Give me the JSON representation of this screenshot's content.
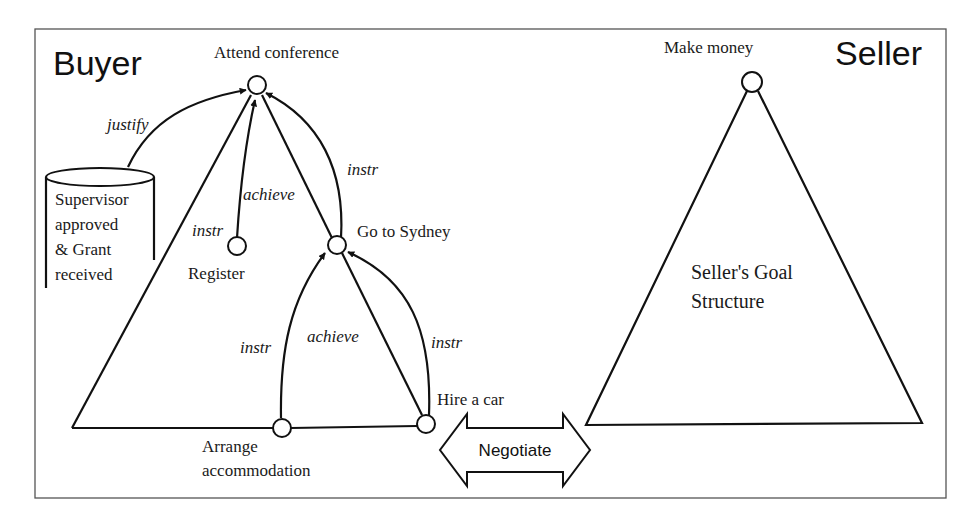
{
  "diagram": {
    "parties": {
      "buyer": {
        "title": "Buyer"
      },
      "seller": {
        "title": "Seller"
      }
    },
    "buyer_nodes": {
      "attend": "Attend conference",
      "register": "Register",
      "sydney": "Go to Sydney",
      "accommodation_line1": "Arrange",
      "accommodation_line2": "accommodation",
      "car": "Hire a car"
    },
    "belief_store": {
      "lines": [
        "Supervisor",
        "approved",
        "& Grant",
        "received"
      ]
    },
    "edge_labels": {
      "justify": "justify",
      "instr_left": "instr",
      "achieve_register": "achieve",
      "instr_sydney_top": "instr",
      "instr_accommodation": "instr",
      "achieve_car": "achieve",
      "instr_car": "instr"
    },
    "seller_nodes": {
      "goal": "Make money",
      "structure_line1": "Seller's Goal",
      "structure_line2": "Structure"
    },
    "negotiate": {
      "label": "Negotiate"
    },
    "colors": {
      "stroke": "#111111",
      "frame": "#555555",
      "background": "#ffffff"
    }
  }
}
